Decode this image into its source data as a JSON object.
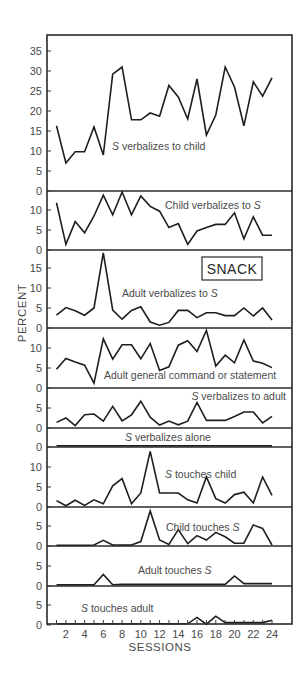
{
  "chart_data": {
    "type": "line",
    "layout": "stacked-small-multiples",
    "title": "",
    "xlabel": "SESSIONS",
    "ylabel": "PERCENT",
    "annotation": "SNACK",
    "x": [
      1,
      2,
      3,
      4,
      5,
      6,
      7,
      8,
      9,
      10,
      11,
      12,
      13,
      14,
      15,
      16,
      17,
      18,
      19,
      20,
      21,
      22,
      23,
      24
    ],
    "x_tick_labels": [
      "2",
      "4",
      "6",
      "8",
      "10",
      "12",
      "14",
      "16",
      "18",
      "20",
      "22",
      "24"
    ],
    "grid": false,
    "legend": "none",
    "panels": [
      {
        "name": "S verbalizes to child",
        "label_parts": [
          {
            "text": "S",
            "italic": true
          },
          {
            "text": " verbalizes to child",
            "italic": false
          }
        ],
        "y_ticks": [
          0,
          5,
          10,
          15,
          20,
          25,
          30,
          35
        ],
        "ylim": [
          0,
          38
        ],
        "values": [
          16.3,
          7,
          9.8,
          9.8,
          16,
          9,
          29.2,
          31,
          17.8,
          17.8,
          19.5,
          18.7,
          26.4,
          23.5,
          18,
          28,
          14,
          19,
          31,
          26,
          16.3,
          27.3,
          23.7,
          28.3
        ]
      },
      {
        "name": "Child verbalizes to S",
        "label_parts": [
          {
            "text": "Child verbalizes to ",
            "italic": false
          },
          {
            "text": "S",
            "italic": true
          }
        ],
        "y_ticks": [
          0,
          5,
          10
        ],
        "ylim": [
          0,
          15
        ],
        "values": [
          11.8,
          1.4,
          7.1,
          4.3,
          8.5,
          13.7,
          8.8,
          14.5,
          8.8,
          13.5,
          10.9,
          9.7,
          5.6,
          6.6,
          1.4,
          4.75,
          5.6,
          6.4,
          6.4,
          9.3,
          2.8,
          8.3,
          3.7,
          3.7
        ]
      },
      {
        "name": "Adult verbalizes to S",
        "label_parts": [
          {
            "text": "Adult verbalizes to ",
            "italic": false
          },
          {
            "text": "S",
            "italic": true
          }
        ],
        "y_ticks": [
          0,
          5,
          10,
          15
        ],
        "ylim": [
          0,
          19.5
        ],
        "values": [
          3.2,
          5.1,
          4.3,
          3.2,
          5,
          18.8,
          4.5,
          2.2,
          4.4,
          5.3,
          1.5,
          0.7,
          1.4,
          4.4,
          4.4,
          2.6,
          3.8,
          3.8,
          3.1,
          3.1,
          5,
          3,
          5,
          2
        ]
      },
      {
        "name": "Adult general command or statement",
        "label_parts": [
          {
            "text": "Adult general command or statement",
            "italic": false
          }
        ],
        "y_ticks": [
          0,
          5,
          10
        ],
        "ylim": [
          0,
          15
        ],
        "values": [
          4.7,
          7.4,
          6.5,
          5.7,
          1.2,
          12.3,
          7.2,
          10.8,
          10.8,
          7.3,
          11.1,
          4.4,
          5.3,
          10.7,
          11.8,
          9.1,
          14.4,
          5.5,
          8.2,
          6.3,
          12,
          6.75,
          6.2,
          5.1
        ]
      },
      {
        "name": "S verbalizes to adult",
        "label_parts": [
          {
            "text": "S",
            "italic": true
          },
          {
            "text": " verbalizes to adult",
            "italic": false
          }
        ],
        "y_ticks": [
          0,
          5
        ],
        "ylim": [
          0,
          10
        ],
        "values": [
          1.4,
          2.5,
          0.6,
          3.3,
          3.5,
          1.7,
          5.4,
          1.8,
          3.3,
          6.7,
          2.7,
          0.75,
          1.75,
          0.8,
          1.7,
          6.4,
          1.9,
          1.9,
          1.9,
          2.9,
          4,
          4,
          1.25,
          2.9
        ]
      },
      {
        "name": "S verbalizes alone",
        "label_parts": [
          {
            "text": "S",
            "italic": true
          },
          {
            "text": " verbalizes alone",
            "italic": false
          }
        ],
        "y_ticks": [
          0
        ],
        "ylim": [
          0,
          5
        ],
        "values": [
          0.3,
          0.3,
          0.3,
          0.3,
          0.3,
          0.3,
          0.3,
          0.3,
          0.3,
          0.3,
          0.3,
          0.3,
          0.3,
          0.3,
          0.3,
          0.3,
          0.3,
          0.3,
          0.3,
          0.3,
          0.3,
          0.3,
          0.3,
          0.3
        ]
      },
      {
        "name": "S touches child",
        "label_parts": [
          {
            "text": "S",
            "italic": true
          },
          {
            "text": " touches child",
            "italic": false
          }
        ],
        "y_ticks": [
          0,
          5,
          10
        ],
        "ylim": [
          0,
          15
        ],
        "values": [
          1.6,
          0.3,
          1.7,
          0.4,
          1.8,
          0.8,
          5.3,
          7.1,
          0.8,
          3.5,
          13.9,
          3.5,
          3.5,
          3.5,
          1.8,
          1,
          7.5,
          2.1,
          1,
          3.1,
          3.7,
          1,
          7.5,
          2.9
        ]
      },
      {
        "name": "Child touches S",
        "label_parts": [
          {
            "text": "Child touches ",
            "italic": false
          },
          {
            "text": "S",
            "italic": true
          }
        ],
        "y_ticks": [
          0,
          5
        ],
        "ylim": [
          0,
          10
        ],
        "values": [
          0.2,
          0.2,
          0.2,
          0.2,
          0.25,
          1.4,
          0.25,
          0.25,
          0.25,
          1.1,
          8.75,
          1.5,
          0.4,
          4.1,
          0.6,
          2.6,
          1.5,
          3.4,
          2.3,
          0.7,
          0.7,
          5.25,
          4.4,
          0.25
        ]
      },
      {
        "name": "Adult touches S",
        "label_parts": [
          {
            "text": "Adult touches ",
            "italic": false
          },
          {
            "text": "S",
            "italic": true
          }
        ],
        "y_ticks": [
          0,
          5
        ],
        "ylim": [
          0,
          10
        ],
        "values": [
          0.3,
          0.3,
          0.3,
          0.3,
          0.3,
          2.9,
          0.3,
          0.4,
          0.4,
          0.4,
          0.4,
          0.4,
          0.4,
          0.4,
          0.4,
          0.4,
          0.4,
          0.4,
          0.4,
          2.5,
          0.6,
          0.6,
          0.6,
          0.6
        ]
      },
      {
        "name": "S touches adult",
        "label_parts": [
          {
            "text": "S",
            "italic": true
          },
          {
            "text": " touches adult",
            "italic": false
          }
        ],
        "y_ticks": [
          0,
          5
        ],
        "ylim": [
          0,
          10
        ],
        "values": [
          0.3,
          0.3,
          0.3,
          0.3,
          0.3,
          0.3,
          0.3,
          0.3,
          0.3,
          0.3,
          0.3,
          0.3,
          0.3,
          0.3,
          0.3,
          1.9,
          0.2,
          2.2,
          0.6,
          0.6,
          0.6,
          0.6,
          0.6,
          1.2
        ]
      }
    ]
  }
}
